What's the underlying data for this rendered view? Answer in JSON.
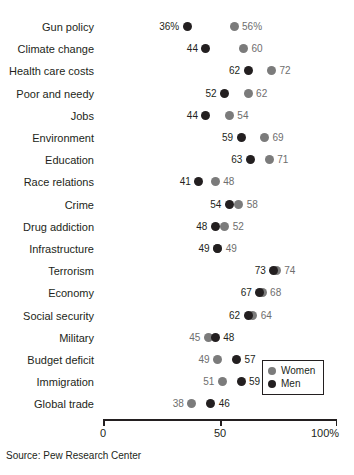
{
  "chart_data": {
    "type": "scatter",
    "subtype": "dot-plot-dumbbell",
    "title": "",
    "subtitle": "",
    "xlabel": "",
    "ylabel": "",
    "xlim": [
      0,
      100
    ],
    "xticks": [
      0,
      50,
      100
    ],
    "xtick_labels": [
      "0",
      "50",
      "100%"
    ],
    "grid": false,
    "legend_position": "inside-bottom-right",
    "series": [
      {
        "name": "Women",
        "color": "#7b7b7b",
        "values": [
          56,
          60,
          72,
          62,
          54,
          69,
          71,
          48,
          58,
          52,
          49,
          74,
          68,
          64,
          45,
          49,
          51,
          38
        ]
      },
      {
        "name": "Men",
        "color": "#231f20",
        "values": [
          36,
          44,
          62,
          52,
          44,
          59,
          63,
          41,
          54,
          48,
          49,
          73,
          67,
          62,
          48,
          57,
          59,
          46
        ]
      }
    ],
    "categories": [
      "Gun policy",
      "Climate change",
      "Health care costs",
      "Poor and needy",
      "Jobs",
      "Environment",
      "Education",
      "Race relations",
      "Crime",
      "Drug addiction",
      "Infrastructure",
      "Terrorism",
      "Economy",
      "Social security",
      "Military",
      "Budget deficit",
      "Immigration",
      "Global trade"
    ],
    "rows": [
      {
        "label": "Gun policy",
        "men": 36,
        "women": 56,
        "men_label": "36%",
        "women_label": "56%"
      },
      {
        "label": "Climate change",
        "men": 44,
        "women": 60,
        "men_label": "44",
        "women_label": "60"
      },
      {
        "label": "Health care costs",
        "men": 62,
        "women": 72,
        "men_label": "62",
        "women_label": "72"
      },
      {
        "label": "Poor and needy",
        "men": 52,
        "women": 62,
        "men_label": "52",
        "women_label": "62"
      },
      {
        "label": "Jobs",
        "men": 44,
        "women": 54,
        "men_label": "44",
        "women_label": "54"
      },
      {
        "label": "Environment",
        "men": 59,
        "women": 69,
        "men_label": "59",
        "women_label": "69"
      },
      {
        "label": "Education",
        "men": 63,
        "women": 71,
        "men_label": "63",
        "women_label": "71"
      },
      {
        "label": "Race relations",
        "men": 41,
        "women": 48,
        "men_label": "41",
        "women_label": "48"
      },
      {
        "label": "Crime",
        "men": 54,
        "women": 58,
        "men_label": "54",
        "women_label": "58"
      },
      {
        "label": "Drug addiction",
        "men": 48,
        "women": 52,
        "men_label": "48",
        "women_label": "52"
      },
      {
        "label": "Infrastructure",
        "men": 49,
        "women": 49,
        "men_label": "49",
        "women_label": "49"
      },
      {
        "label": "Terrorism",
        "men": 73,
        "women": 74,
        "men_label": "73",
        "women_label": "74"
      },
      {
        "label": "Economy",
        "men": 67,
        "women": 68,
        "men_label": "67",
        "women_label": "68"
      },
      {
        "label": "Social security",
        "men": 62,
        "women": 64,
        "men_label": "62",
        "women_label": "64"
      },
      {
        "label": "Military",
        "men": 48,
        "women": 45,
        "men_label": "48",
        "women_label": "45"
      },
      {
        "label": "Budget deficit",
        "men": 57,
        "women": 49,
        "men_label": "57",
        "women_label": "49"
      },
      {
        "label": "Immigration",
        "men": 59,
        "women": 51,
        "men_label": "59",
        "women_label": "51"
      },
      {
        "label": "Global trade",
        "men": 46,
        "women": 38,
        "men_label": "46",
        "women_label": "38"
      }
    ]
  },
  "axis": {
    "ticks": [
      {
        "value": 0,
        "label": "0"
      },
      {
        "value": 50,
        "label": "50"
      },
      {
        "value": 100,
        "label": "100%"
      }
    ]
  },
  "legend": {
    "items": [
      {
        "name": "Women",
        "color": "#7b7b7b"
      },
      {
        "name": "Men",
        "color": "#231f20"
      }
    ]
  },
  "source": {
    "text": "Source: Pew Research Center"
  }
}
